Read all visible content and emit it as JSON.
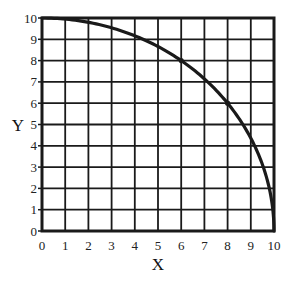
{
  "chart_data": {
    "type": "line",
    "title": "",
    "xlabel": "X",
    "ylabel": "Y",
    "xlim": [
      0,
      10
    ],
    "ylim": [
      0,
      10
    ],
    "grid": true,
    "x_ticks": [
      "0",
      "1",
      "2",
      "3",
      "4",
      "5",
      "6",
      "7",
      "8",
      "9",
      "10"
    ],
    "y_ticks": [
      "0",
      "1",
      "2",
      "3",
      "4",
      "5",
      "6",
      "7",
      "8",
      "9",
      "10"
    ],
    "series": [
      {
        "name": "curve",
        "description": "quarter circle x^2 + y^2 = 100",
        "x": [
          0,
          1,
          2,
          3,
          4,
          5,
          6,
          7,
          8,
          9,
          9.5,
          10
        ],
        "y": [
          10,
          9.95,
          9.8,
          9.54,
          9.17,
          8.66,
          8,
          7.14,
          6,
          4.36,
          3.12,
          0
        ]
      }
    ],
    "marked_points": [
      {
        "x": 6,
        "y": 8
      },
      {
        "x": 8,
        "y": 6
      }
    ],
    "legend": null
  },
  "colors": {
    "grid": "#1a1a1a",
    "curve": "#1a1a1a",
    "background": "#ffffff"
  }
}
